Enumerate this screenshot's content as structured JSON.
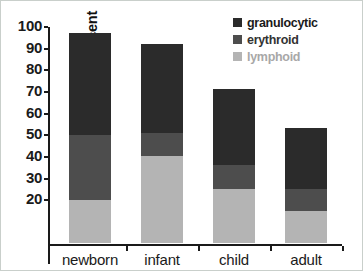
{
  "chart_data": {
    "type": "bar",
    "subtype": "stacked-bar",
    "title": "",
    "xlabel": "",
    "ylabel": "cellularity percent",
    "categories": [
      "newborn",
      "infant",
      "child",
      "adult"
    ],
    "ylim": [
      0,
      100
    ],
    "yticks": [
      100,
      90,
      80,
      70,
      60,
      50,
      40,
      30,
      20
    ],
    "ytick_labels": [
      "100",
      "90",
      "80",
      "70",
      "60",
      "50",
      "40",
      "30",
      "20"
    ],
    "grid": false,
    "legend_position": "top-right",
    "series": [
      {
        "name": "granulocytic",
        "color": "#2b2b2b",
        "values": [
          47,
          41,
          35,
          28
        ]
      },
      {
        "name": "erythroid",
        "color": "#4d4d4d",
        "values": [
          30,
          11,
          11,
          10
        ]
      },
      {
        "name": "lymphoid",
        "color": "#b4b4b4",
        "values": [
          20,
          40,
          25,
          15
        ]
      }
    ],
    "stack_order_bottom_to_top": [
      "lymphoid",
      "erythroid",
      "granulocytic"
    ],
    "cumulative_tops": {
      "newborn": {
        "lymphoid": 20,
        "erythroid": 50,
        "granulocytic": 97
      },
      "infant": {
        "lymphoid": 40,
        "erythroid": 51,
        "granulocytic": 92
      },
      "child": {
        "lymphoid": 25,
        "erythroid": 36,
        "granulocytic": 71
      },
      "adult": {
        "lymphoid": 15,
        "erythroid": 25,
        "granulocytic": 53
      }
    },
    "bar_totals": [
      97,
      92,
      71,
      53
    ]
  },
  "legend": {
    "items": [
      {
        "label": "granulocytic",
        "color": "#2b2b2b"
      },
      {
        "label": "erythroid",
        "color": "#4d4d4d"
      },
      {
        "label": "lymphoid",
        "color": "#b4b4b4"
      }
    ]
  },
  "axes": {
    "y_label": "cellularity percent",
    "y_ticks": [
      "100",
      "90",
      "80",
      "70",
      "60",
      "50",
      "40",
      "30",
      "20"
    ],
    "x_categories": [
      "newborn",
      "infant",
      "child",
      "adult"
    ]
  },
  "colors": {
    "granulocytic": "#2b2b2b",
    "erythroid": "#4d4d4d",
    "lymphoid": "#b4b4b4",
    "axis": "#1a1a1a",
    "frame": "#c9cfcb",
    "background": "#ffffff"
  }
}
